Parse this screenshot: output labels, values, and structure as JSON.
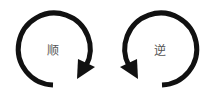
{
  "diagram": {
    "clockwise": {
      "label": "顺",
      "direction": "clockwise",
      "icon": "clockwise-arrow-icon"
    },
    "counterclockwise": {
      "label": "逆",
      "direction": "counterclockwise",
      "icon": "counterclockwise-arrow-icon"
    },
    "stroke_color": "#111111"
  }
}
